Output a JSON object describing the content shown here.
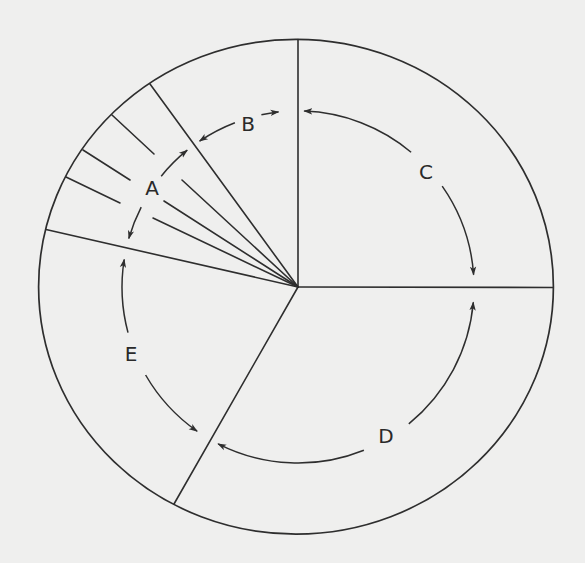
{
  "diagram": {
    "type": "circular-sector-cycle",
    "background": "#efefee",
    "line_color": "#2e2e2e",
    "outer_ellipse": {
      "cx": 296,
      "cy": 286.7,
      "rx": 257.4,
      "ry": 247.4
    },
    "hub": {
      "x": 298,
      "y": 287
    },
    "labels": [
      {
        "id": "A",
        "text": "A",
        "x": 152,
        "y": 188
      },
      {
        "id": "B",
        "text": "B",
        "x": 248,
        "y": 124
      },
      {
        "id": "C",
        "text": "C",
        "x": 426,
        "y": 172
      },
      {
        "id": "D",
        "text": "D",
        "x": 386,
        "y": 436
      },
      {
        "id": "E",
        "text": "E",
        "x": 131,
        "y": 354
      }
    ],
    "sectors": [
      {
        "id": "A",
        "description": "subdivided into 4 narrow slices"
      },
      {
        "id": "B",
        "description": "narrow sector, upper-left of vertical line"
      },
      {
        "id": "C",
        "description": "upper-right quadrant"
      },
      {
        "id": "D",
        "description": "lower-right"
      },
      {
        "id": "E",
        "description": "left / lower-left"
      }
    ]
  }
}
